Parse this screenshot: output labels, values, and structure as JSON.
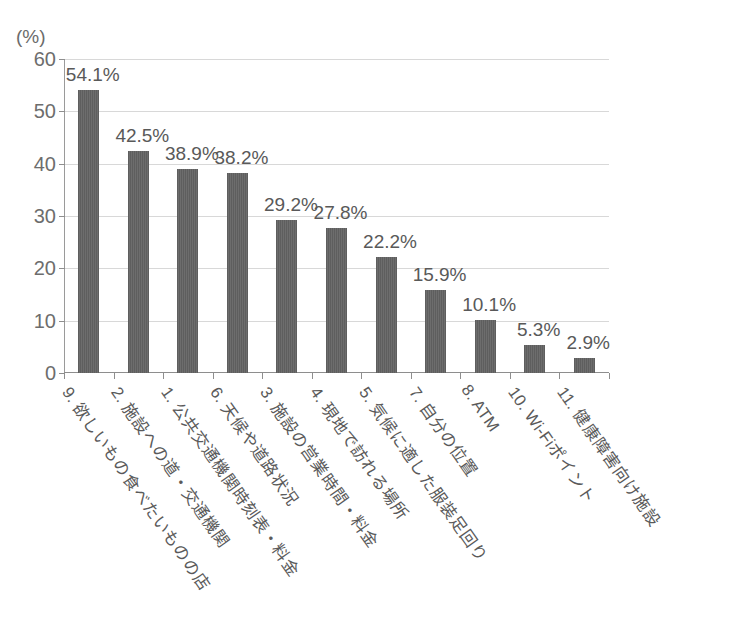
{
  "chart_data": {
    "type": "bar",
    "title": "",
    "subtitle": "",
    "xlabel": "",
    "ylabel": "",
    "yunit": "(%)",
    "ylim": [
      0,
      60
    ],
    "ytick_step": 10,
    "yticks": [
      "0",
      "10",
      "20",
      "30",
      "40",
      "50",
      "60"
    ],
    "grid": "horizontal",
    "legend": "none",
    "bar_color": "#646464",
    "categories": [
      "9. 欲しいもの食べたいものの店",
      "2. 施設への道・交通機関",
      "1. 公共交通機関時刻表・料金",
      "6. 天候や道路状況",
      "3. 施設の営業時間・料金",
      "4. 現地で訪れる場所",
      "5. 気候に適した服装足回り",
      "7. 自分の位置",
      "8. ATM",
      "10. Wi-Fiポイント",
      "11. 健康障害向け施設"
    ],
    "values": [
      54.1,
      42.5,
      38.9,
      38.2,
      29.2,
      27.8,
      22.2,
      15.9,
      10.1,
      5.3,
      2.9
    ],
    "value_labels": [
      "54.1%",
      "42.5%",
      "38.9%",
      "38.2%",
      "29.2%",
      "27.8%",
      "22.2%",
      "15.9%",
      "10.1%",
      "5.3%",
      "2.9%"
    ]
  }
}
